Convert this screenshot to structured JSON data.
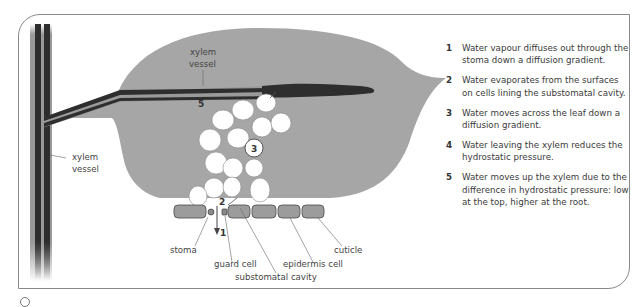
{
  "diagram": {
    "labels": {
      "xylem_vessel_leaf": [
        "xylem",
        "vessel"
      ],
      "xylem_vessel_stem": [
        "xylem",
        "vessel"
      ],
      "stoma": "stoma",
      "guard_cell": "guard cell",
      "substomatal_cavity": "substomatal cavity",
      "epidermis_cell": "epidermis cell",
      "cuticle": "cuticle"
    },
    "markers": {
      "m1": "1",
      "m2": "2",
      "m3": "3",
      "m5": "5"
    },
    "colors": {
      "leaf": "#a6a6a6",
      "xylem": "#2e2e2e",
      "cell": "#ffffff",
      "epidermis": "#9a9a9a",
      "frame": "#8a8a8a"
    }
  },
  "steps": [
    {
      "num": "1",
      "text": "Water vapour diffuses out through the stoma down a diffusion gradient."
    },
    {
      "num": "2",
      "text": "Water evaporates from the surfaces on cells lining the substomatal cavity."
    },
    {
      "num": "3",
      "text": "Water moves across the leaf down a diffusion gradient."
    },
    {
      "num": "4",
      "text": "Water leaving the xylem reduces the hydrostatic pressure."
    },
    {
      "num": "5",
      "text": "Water moves up the xylem due to the difference in hydrostatic pressure: low at the top, higher at the root."
    }
  ]
}
